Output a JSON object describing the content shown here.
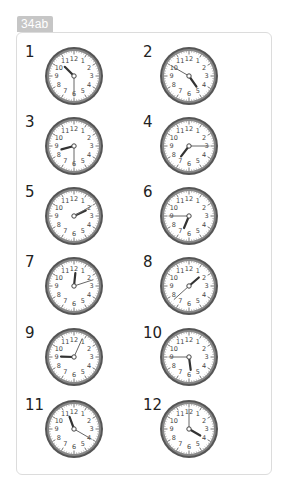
{
  "header": {
    "badge_label": "34ab"
  },
  "clocks": [
    {
      "label": "1",
      "time": "10:30",
      "hour": 10,
      "minute": 30
    },
    {
      "label": "2",
      "time": "4:50",
      "hour": 4,
      "minute": 50
    },
    {
      "label": "3",
      "time": "8:30",
      "hour": 8,
      "minute": 30
    },
    {
      "label": "4",
      "time": "7:15",
      "hour": 7,
      "minute": 15
    },
    {
      "label": "5",
      "time": "2:10",
      "hour": 2,
      "minute": 10
    },
    {
      "label": "6",
      "time": "6:45",
      "hour": 6,
      "minute": 45
    },
    {
      "label": "7",
      "time": "12:12",
      "hour": 12,
      "minute": 12
    },
    {
      "label": "8",
      "time": "1:38",
      "hour": 1,
      "minute": 38
    },
    {
      "label": "9",
      "time": "9:04",
      "hour": 9,
      "minute": 4
    },
    {
      "label": "10",
      "time": "5:45",
      "hour": 5,
      "minute": 45
    },
    {
      "label": "11",
      "time": "11:20",
      "hour": 11,
      "minute": 20
    },
    {
      "label": "12",
      "time": "4:00",
      "hour": 4,
      "minute": 0
    }
  ],
  "dial_numbers": [
    "12",
    "1",
    "2",
    "3",
    "4",
    "5",
    "6",
    "7",
    "8",
    "9",
    "10",
    "11"
  ],
  "colors": {
    "badge_bg": "#c6c6c6",
    "bezel": "#555555",
    "hand": "#333333",
    "card_border": "#dcdcdc"
  }
}
